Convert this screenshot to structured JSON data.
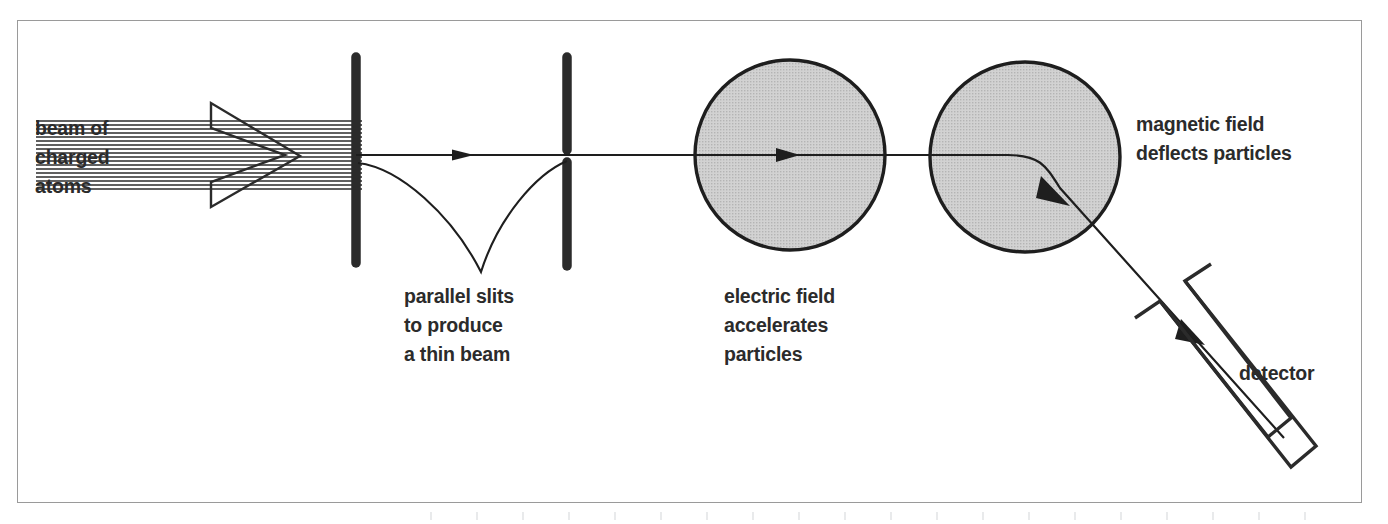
{
  "figure": {
    "type": "schematic-diagram",
    "frame": {
      "stroke": "#9a9a9a",
      "x": 17,
      "y": 20,
      "width": 1345,
      "height": 483
    },
    "ink_color": "#2b2b2b",
    "field_fill": "#c9c9c9"
  },
  "labels": {
    "beam": "beam of\ncharged\natoms",
    "slits": "parallel slits\nto produce\na thin beam",
    "electric": "electric field\naccelerates\nparticles",
    "magnetic": "magnetic field\ndeflects particles",
    "detector": "detector"
  },
  "components": [
    {
      "name": "charged-atom-beam",
      "kind": "hatched-arrow",
      "x": 130,
      "y": 120,
      "width": 230,
      "height": 72
    },
    {
      "name": "first-slit",
      "kind": "solid-bar",
      "cx": 356,
      "top": 55,
      "bottom": 265
    },
    {
      "name": "second-slit",
      "kind": "split-bar",
      "cx": 567,
      "top": 55,
      "bottom": 268,
      "gap_center": 155
    },
    {
      "name": "electric-field-region",
      "kind": "circle",
      "cx": 790,
      "cy": 155,
      "r": 95
    },
    {
      "name": "magnetic-field-region",
      "kind": "circle",
      "cx": 1025,
      "cy": 157,
      "r": 95
    },
    {
      "name": "detector",
      "kind": "tilted-channel",
      "angle_deg": 52
    }
  ],
  "beam_path": {
    "straight_from_x": 356,
    "straight_y": 155,
    "bend_start_x": 1010,
    "exit_point": [
      1282,
      437
    ],
    "arrowheads": [
      {
        "at": [
          468,
          155
        ],
        "dir": "right"
      },
      {
        "at": [
          790,
          155
        ],
        "dir": "right"
      },
      {
        "at": [
          1060,
          195
        ],
        "dir": "down-right"
      },
      {
        "at": [
          1196,
          338
        ],
        "dir": "down-right"
      }
    ]
  }
}
